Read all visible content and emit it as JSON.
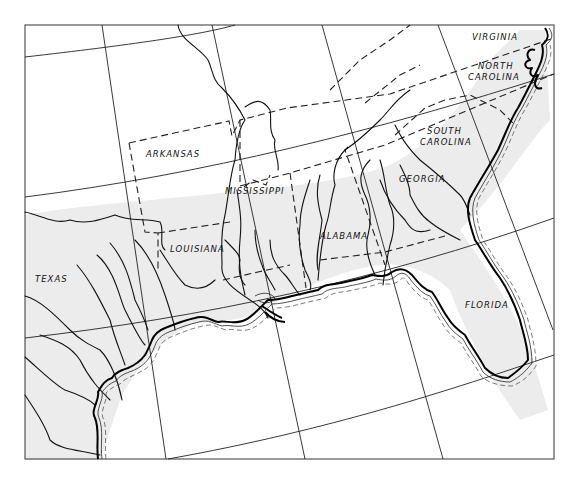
{
  "map": {
    "title": "Southeastern United States",
    "frame": {
      "left": 25,
      "top": 25,
      "right": 554,
      "bottom": 459
    },
    "shade_color": "#ececec",
    "line_color": "#111111",
    "states": [
      {
        "id": "virginia",
        "label": "VIRGINIA",
        "x": 472,
        "y": 40
      },
      {
        "id": "north-carolina-1",
        "label": "NORTH",
        "x": 478,
        "y": 69
      },
      {
        "id": "north-carolina-2",
        "label": "CAROLINA",
        "x": 468,
        "y": 80
      },
      {
        "id": "south-carolina-1",
        "label": "SOUTH",
        "x": 427,
        "y": 134
      },
      {
        "id": "south-carolina-2",
        "label": "CAROLINA",
        "x": 420,
        "y": 145
      },
      {
        "id": "arkansas",
        "label": "ARKANSAS",
        "x": 146,
        "y": 157
      },
      {
        "id": "georgia",
        "label": "GEORGIA",
        "x": 399,
        "y": 182
      },
      {
        "id": "mississippi",
        "label": "MISSISSIPPI",
        "x": 225,
        "y": 194
      },
      {
        "id": "alabama",
        "label": "ALABAMA",
        "x": 320,
        "y": 239
      },
      {
        "id": "louisiana",
        "label": "LOUISIANA",
        "x": 170,
        "y": 252
      },
      {
        "id": "texas",
        "label": "TEXAS",
        "x": 35,
        "y": 282
      },
      {
        "id": "florida",
        "label": "FLORIDA",
        "x": 465,
        "y": 308
      }
    ]
  }
}
